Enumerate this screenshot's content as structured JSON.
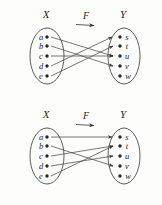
{
  "figure": {
    "stroke_color": "#4a4a4a",
    "text_color": "#1f1f1f",
    "background_color": "#fdfdfc"
  },
  "diagrams": [
    {
      "id": "top",
      "domain_label": "X",
      "codomain_label": "Y",
      "function_label": "F",
      "domain_elements": [
        "a",
        "b",
        "c",
        "d",
        "e"
      ],
      "codomain_elements": [
        "s",
        "t",
        "u",
        "v",
        "w"
      ],
      "mappings": [
        {
          "from": "a",
          "to": "u"
        },
        {
          "from": "b",
          "to": "v"
        },
        {
          "from": "c",
          "to": "u"
        },
        {
          "from": "d",
          "to": "s"
        },
        {
          "from": "e",
          "to": "t"
        }
      ]
    },
    {
      "id": "bottom",
      "domain_label": "X",
      "codomain_label": "Y",
      "function_label": "F",
      "domain_elements": [
        "a",
        "b",
        "c",
        "d",
        "e"
      ],
      "codomain_elements": [
        "s",
        "t",
        "u",
        "v",
        "w"
      ],
      "mappings": [
        {
          "from": "a",
          "to": "s"
        },
        {
          "from": "b",
          "to": "v"
        },
        {
          "from": "c",
          "to": "t"
        },
        {
          "from": "d",
          "to": "u"
        },
        {
          "from": "e",
          "to": "t"
        }
      ]
    }
  ]
}
